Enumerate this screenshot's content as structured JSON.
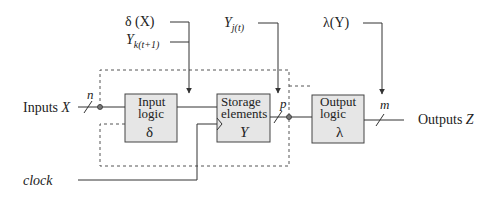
{
  "diagram": {
    "type": "sequential-circuit-block-diagram",
    "blocks": [
      {
        "id": "input-logic",
        "label_line1": "Input",
        "label_line2": "logic",
        "symbol": "δ"
      },
      {
        "id": "storage-elements",
        "label_line1": "Storage",
        "label_line2": "elements",
        "symbol": "Y"
      },
      {
        "id": "output-logic",
        "label_line1": "Output",
        "label_line2": "logic",
        "symbol": "λ"
      }
    ],
    "annotations": {
      "delta_x": "δ (X)",
      "y_k_main": "Y",
      "y_k_sub": "k(t+1)",
      "y_j_main": "Y",
      "y_j_sub": "j(t)",
      "lambda_y": "λ(Y)"
    },
    "inputs": {
      "prefix": "Inputs ",
      "var": "X",
      "bus_width": "n"
    },
    "outputs": {
      "prefix": "Outputs ",
      "var": "Z",
      "bus_width": "m"
    },
    "storage_bus_width": "p",
    "clock_label": "clock",
    "colors": {
      "block_fill": "#e6e6e6",
      "line": "#333333",
      "dashed": "#555555"
    }
  }
}
